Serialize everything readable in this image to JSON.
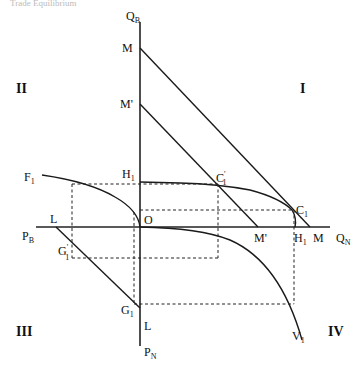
{
  "header": {
    "text": "Trade Equilibrium"
  },
  "quadrants": {
    "q1": "I",
    "q2": "II",
    "q3": "III",
    "q4": "IV"
  },
  "axes": {
    "vertical_top": {
      "main": "Q",
      "sub": "B"
    },
    "vertical_bottom": {
      "main": "P",
      "sub": "N"
    },
    "horizontal_right": {
      "main": "Q",
      "sub": "N"
    },
    "horizontal_left": {
      "main": "P",
      "sub": "B"
    },
    "origin": "O"
  },
  "points": {
    "M_top": "M",
    "M_prime_top": "M'",
    "H1_top": {
      "main": "H",
      "sub": "1"
    },
    "C1_prime": {
      "main": "C",
      "sub": "1",
      "prime": "'"
    },
    "C1": {
      "main": "C",
      "sub": "1"
    },
    "M_prime_axis": "M'",
    "H1_axis": {
      "main": "H",
      "sub": "1"
    },
    "M_axis": "M",
    "F1": {
      "main": "F",
      "sub": "1"
    },
    "L_axis": "L",
    "G1_prime": {
      "main": "G",
      "sub": "1",
      "prime": "'"
    },
    "G1": {
      "main": "G",
      "sub": "1"
    },
    "L_vertical": "L",
    "V1": {
      "main": "V",
      "sub": "1"
    }
  }
}
